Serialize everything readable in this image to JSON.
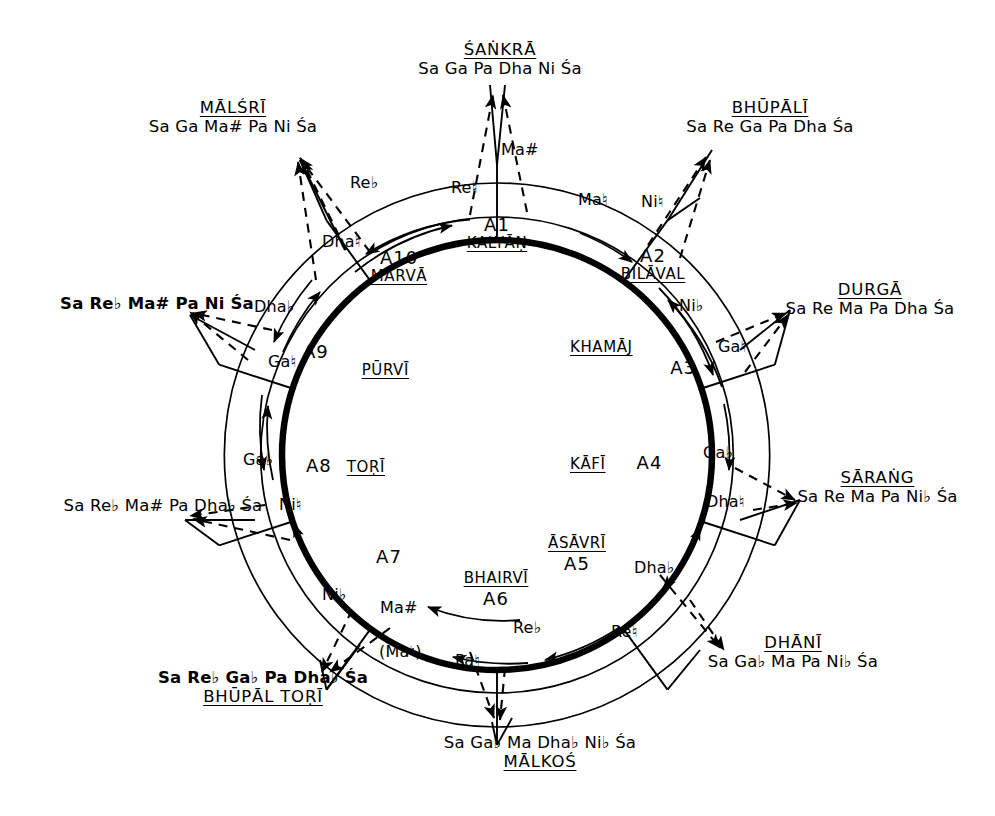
{
  "diagram": {
    "stroke_color": "#000000",
    "background": "#ffffff"
  },
  "sectors": [
    {
      "code": "A1",
      "name": "KALYĀṆ"
    },
    {
      "code": "A2",
      "name": "BILĀVAL"
    },
    {
      "code": "A3",
      "name": "KHAMĀJ"
    },
    {
      "code": "A4",
      "name": "KĀFĪ"
    },
    {
      "code": "A5",
      "name": "ĀSĀVRĪ"
    },
    {
      "code": "A6",
      "name": "BHAIRVĪ"
    },
    {
      "code": "A7",
      "name": ""
    },
    {
      "code": "A8",
      "name": "TOṚĪ"
    },
    {
      "code": "A9",
      "name": "PŪRVĪ"
    },
    {
      "code": "A10",
      "name": "MĀRVĀ"
    }
  ],
  "ragas": [
    {
      "id": "sankra",
      "name": "ŚAṄKRĀ",
      "notes": "Sa Ga Pa Dha Ni Śa",
      "bold": false,
      "name_on_top": true
    },
    {
      "id": "bhupali",
      "name": "BHŪPĀLĪ",
      "notes": "Sa Re Ga Pa Dha Śa",
      "bold": false,
      "name_on_top": true
    },
    {
      "id": "durga",
      "name": "DURGĀ",
      "notes": "Sa Re Ma Pa Dha Śa",
      "bold": false,
      "name_on_top": true
    },
    {
      "id": "sarang",
      "name": "SĀRAṄG",
      "notes": "Sa Re Ma Pa Ni♭ Śa",
      "bold": false,
      "name_on_top": true
    },
    {
      "id": "dhani",
      "name": "DHĀNĪ",
      "notes": "Sa Ga♭ Ma Pa Ni♭ Śa",
      "bold": false,
      "name_on_top": true
    },
    {
      "id": "malkos",
      "name": "MĀLKOŚ",
      "notes": "Sa Ga♭ Ma Dha♭ Ni♭ Śa",
      "bold": false,
      "name_on_top": false
    },
    {
      "id": "bhupaltori",
      "name": "BHŪPĀL TOṚĪ",
      "notes": "Sa Re♭ Ga♭ Pa Dha♭ Śa",
      "bold": true,
      "name_on_top": false
    },
    {
      "id": "left_low",
      "name": "",
      "notes": "Sa Re♭ Ma# Pa Dha♭ Śa",
      "bold": false,
      "name_on_top": true
    },
    {
      "id": "left_mid",
      "name": "",
      "notes": "Sa Re♭ Ma# Pa Ni Śa",
      "bold": true,
      "name_on_top": true
    },
    {
      "id": "malsri",
      "name": "MĀLŚRĪ",
      "notes": "Sa Ga Ma# Pa Ni Śa",
      "bold": false,
      "name_on_top": true
    }
  ],
  "ring_notes": [
    {
      "id": "n-re-flat",
      "text": "Re♭"
    },
    {
      "id": "n-re-nat",
      "text": "Re♮"
    },
    {
      "id": "n-ma-sharp-top",
      "text": "Ma#"
    },
    {
      "id": "n-ma-nat",
      "text": "Ma♮"
    },
    {
      "id": "n-ni-nat-top",
      "text": "Ni♮"
    },
    {
      "id": "n-ni-flat-top",
      "text": "Ni♭"
    },
    {
      "id": "n-ga-nat-right",
      "text": "Ga♮"
    },
    {
      "id": "n-ga-flat-right",
      "text": "Ga♭"
    },
    {
      "id": "n-dha-nat",
      "text": "Dha♮"
    },
    {
      "id": "n-dha-flat-r",
      "text": "Dha♭"
    },
    {
      "id": "n-re-nat-low",
      "text": "Re♮"
    },
    {
      "id": "n-re-flat-low",
      "text": "Re♭"
    },
    {
      "id": "n-pa-nat",
      "text": "Pa♮"
    },
    {
      "id": "n-ma-nat-paren",
      "text": "(Ma♮)"
    },
    {
      "id": "n-ma-sharp-low",
      "text": "Ma#"
    },
    {
      "id": "n-ni-flat-low",
      "text": "Ni♭"
    },
    {
      "id": "n-ni-nat-left",
      "text": "Ni♮"
    },
    {
      "id": "n-ga-flat-left",
      "text": "Ga♭"
    },
    {
      "id": "n-ga-nat-left",
      "text": "Ga♮"
    },
    {
      "id": "n-dha-flat-l",
      "text": "Dha♭"
    },
    {
      "id": "n-dha-nat-l",
      "text": "Dha♮"
    }
  ]
}
